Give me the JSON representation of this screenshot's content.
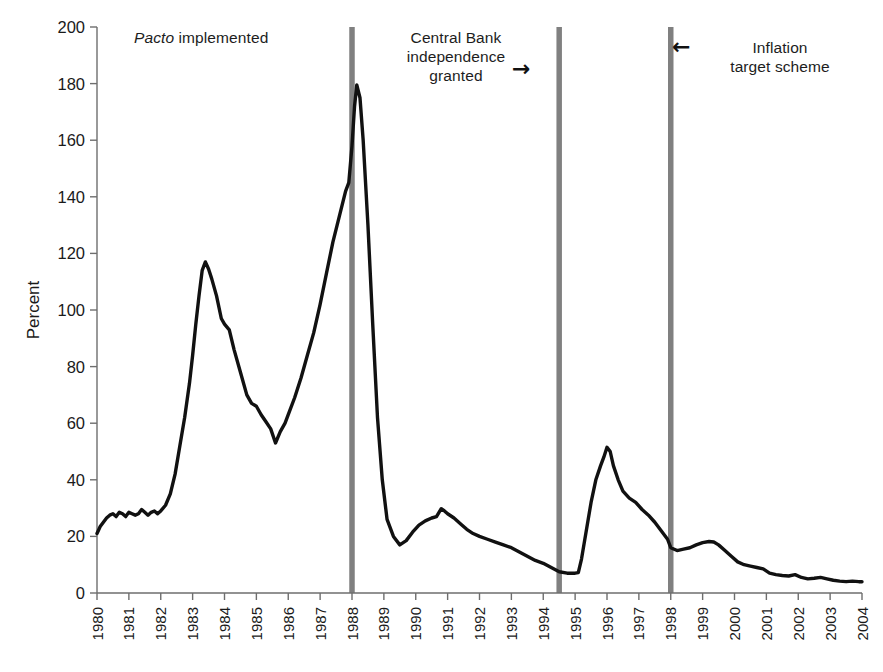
{
  "chart_data": {
    "type": "line",
    "title": "",
    "subtitle": "",
    "xlabel": "",
    "ylabel": "Percent",
    "xlim": [
      1980,
      2004
    ],
    "ylim": [
      0,
      200
    ],
    "ytick_step": 20,
    "grid": false,
    "legend": null,
    "legend_position": "none",
    "yticks": [
      0,
      20,
      40,
      60,
      80,
      100,
      120,
      140,
      160,
      180,
      200
    ],
    "xticks": [
      1980,
      1981,
      1982,
      1983,
      1984,
      1985,
      1986,
      1987,
      1988,
      1989,
      1990,
      1991,
      1992,
      1993,
      1994,
      1995,
      1996,
      1997,
      1998,
      1999,
      2000,
      2001,
      2002,
      2003,
      2004
    ],
    "xtick_labels": [
      "1980",
      "1981",
      "1982",
      "1983",
      "1984",
      "1985",
      "1986",
      "1987",
      "1988",
      "1989",
      "1990",
      "1991",
      "1992",
      "1993",
      "1994",
      "1995",
      "1996",
      "1997",
      "1998",
      "1999",
      "2000",
      "2001",
      "2002",
      "2003",
      "2004"
    ],
    "series": [
      {
        "name": "Inflation rate",
        "color": "#111111",
        "line_width": 3.4,
        "x": [
          1980.0,
          1980.1,
          1980.2,
          1980.3,
          1980.4,
          1980.5,
          1980.6,
          1980.7,
          1980.8,
          1980.9,
          1981.0,
          1981.1,
          1981.2,
          1981.3,
          1981.4,
          1981.5,
          1981.6,
          1981.7,
          1981.8,
          1981.9,
          1982.0,
          1982.15,
          1982.3,
          1982.45,
          1982.6,
          1982.75,
          1982.9,
          1983.0,
          1983.1,
          1983.2,
          1983.3,
          1983.4,
          1983.5,
          1983.6,
          1983.75,
          1983.9,
          1984.0,
          1984.15,
          1984.3,
          1984.5,
          1984.7,
          1984.85,
          1985.0,
          1985.15,
          1985.3,
          1985.45,
          1985.6,
          1985.75,
          1985.9,
          1986.0,
          1986.2,
          1986.4,
          1986.6,
          1986.8,
          1987.0,
          1987.2,
          1987.4,
          1987.6,
          1987.8,
          1987.9,
          1988.0,
          1988.08,
          1988.15,
          1988.25,
          1988.35,
          1988.5,
          1988.65,
          1988.8,
          1988.95,
          1989.1,
          1989.3,
          1989.5,
          1989.7,
          1989.9,
          1990.1,
          1990.3,
          1990.5,
          1990.65,
          1990.8,
          1990.9,
          1991.0,
          1991.2,
          1991.4,
          1991.6,
          1991.8,
          1992.0,
          1992.25,
          1992.5,
          1992.75,
          1993.0,
          1993.25,
          1993.5,
          1993.75,
          1994.0,
          1994.25,
          1994.5,
          1994.75,
          1995.0,
          1995.1,
          1995.2,
          1995.35,
          1995.5,
          1995.65,
          1995.8,
          1995.9,
          1996.0,
          1996.1,
          1996.2,
          1996.35,
          1996.5,
          1996.7,
          1996.9,
          1997.1,
          1997.3,
          1997.5,
          1997.7,
          1997.9,
          1998.0,
          1998.2,
          1998.4,
          1998.6,
          1998.8,
          1999.0,
          1999.2,
          1999.35,
          1999.5,
          1999.7,
          1999.9,
          2000.1,
          2000.3,
          2000.5,
          2000.7,
          2000.9,
          2001.1,
          2001.3,
          2001.5,
          2001.7,
          2001.9,
          2002.1,
          2002.3,
          2002.5,
          2002.7,
          2002.9,
          2003.1,
          2003.3,
          2003.5,
          2003.7,
          2003.9,
          2004.0
        ],
        "y": [
          21.0,
          23.5,
          25.0,
          26.5,
          27.5,
          28.0,
          27.0,
          28.5,
          28.0,
          27.0,
          28.5,
          28.0,
          27.5,
          28.0,
          29.5,
          28.5,
          27.5,
          28.5,
          29.0,
          28.0,
          29.0,
          31.0,
          35.0,
          42.0,
          52.0,
          62.0,
          74.0,
          84.0,
          95.0,
          105.0,
          114.0,
          117.0,
          114.5,
          111.0,
          105.0,
          97.0,
          95.0,
          93.0,
          86.0,
          78.0,
          70.0,
          67.0,
          66.0,
          63.0,
          60.5,
          58.0,
          53.0,
          57.0,
          60.0,
          63.0,
          69.0,
          76.0,
          84.0,
          92.0,
          102.0,
          113.0,
          124.0,
          133.0,
          142.0,
          145.0,
          158.0,
          172.0,
          179.5,
          175.0,
          160.0,
          130.0,
          95.0,
          62.0,
          40.0,
          26.0,
          20.0,
          17.0,
          18.5,
          21.5,
          24.0,
          25.5,
          26.5,
          27.0,
          29.8,
          29.0,
          28.0,
          26.5,
          24.5,
          22.5,
          21.0,
          20.0,
          19.0,
          18.0,
          17.0,
          16.0,
          14.5,
          13.0,
          11.5,
          10.5,
          9.0,
          7.5,
          7.0,
          7.0,
          7.2,
          12.0,
          22.0,
          32.0,
          40.0,
          45.0,
          48.0,
          51.5,
          50.0,
          45.0,
          40.0,
          36.0,
          33.5,
          32.0,
          29.5,
          27.5,
          25.0,
          22.0,
          19.0,
          16.0,
          15.0,
          15.5,
          16.0,
          17.0,
          17.8,
          18.2,
          18.0,
          17.0,
          15.0,
          13.0,
          11.0,
          10.0,
          9.5,
          9.0,
          8.5,
          7.0,
          6.5,
          6.2,
          6.0,
          6.5,
          5.5,
          5.0,
          5.2,
          5.5,
          5.0,
          4.5,
          4.2,
          4.0,
          4.2,
          4.0,
          4.0
        ]
      }
    ],
    "markers": [
      {
        "name": "pacto-marker",
        "x": 1988.0,
        "color": "#808080",
        "width": 5.5
      },
      {
        "name": "central-bank-marker",
        "x": 1994.5,
        "color": "#808080",
        "width": 5.5
      },
      {
        "name": "inflation-target-marker",
        "x": 1998.0,
        "color": "#808080",
        "width": 5.5
      }
    ],
    "annotations": [
      {
        "name": "pacto",
        "text_em": "Pacto",
        "text": " implemented",
        "arrow": "none"
      },
      {
        "name": "central-bank",
        "lines": [
          "Central Bank",
          "independence",
          "granted"
        ],
        "arrow": "right",
        "arrow_glyph": "→"
      },
      {
        "name": "inflation-target",
        "lines": [
          "Inflation",
          "target scheme"
        ],
        "arrow": "left",
        "arrow_glyph": "←"
      }
    ]
  },
  "annotations": {
    "pacto_em": "Pacto",
    "pacto_rest": " implemented",
    "central_bank_line1": "Central Bank",
    "central_bank_line2": "independence",
    "central_bank_line3": "granted",
    "central_bank_arrow": "→",
    "inflation_line1": "Inflation",
    "inflation_line2": "target scheme",
    "inflation_arrow": "←"
  },
  "axes": {
    "ylabel": "Percent"
  }
}
